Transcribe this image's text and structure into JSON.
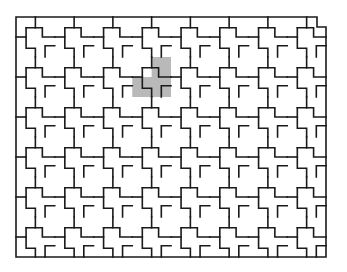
{
  "figure": {
    "origin": [
      16,
      17
    ],
    "block_cols": 8,
    "block_rows": 6,
    "block_width": 38.75,
    "block_height": 40,
    "line_color": "#1a1a1a",
    "background": "#ffffff",
    "highlight": {
      "block_col": 3,
      "block_row": 1,
      "color": "#b9b9b9",
      "shape": "L (2x2 block minus top-left cell)"
    },
    "top_right_notch": true
  }
}
